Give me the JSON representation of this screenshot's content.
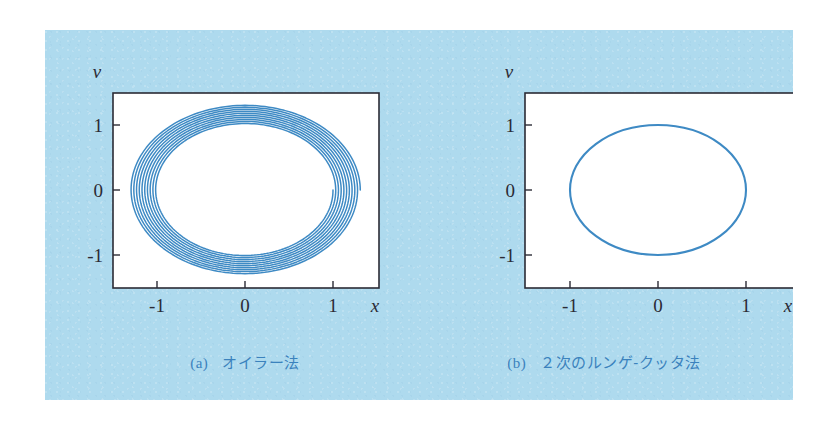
{
  "figure": {
    "background_color": "#aedaee",
    "page_color": "#ffffff",
    "caption_color": "#3b82bd",
    "curve_color": "#3e8ac4",
    "frame_color": "#2b2b35",
    "plot_face_color": "#ffffff"
  },
  "panels": [
    {
      "id": "a",
      "caption_tag": "(a)",
      "caption_text": "オイラー法",
      "xlabel": "x",
      "ylabel": "v",
      "xticks": [
        "-1",
        "0",
        "1"
      ],
      "yticks": [
        "1",
        "0",
        "-1"
      ]
    },
    {
      "id": "b",
      "caption_tag": "(b)",
      "caption_text": "２次のルンゲ-クッタ法",
      "xlabel": "x",
      "ylabel": "v",
      "xticks": [
        "-1",
        "0",
        "1"
      ],
      "yticks": [
        "1",
        "0",
        "-1"
      ]
    }
  ],
  "chart_data": [
    {
      "type": "line",
      "title": "(a) オイラー法",
      "xlabel": "x",
      "ylabel": "v",
      "xlim": [
        -1.45,
        1.52
      ],
      "ylim": [
        -1.49,
        1.53
      ],
      "xticks": [
        -1,
        0,
        1
      ],
      "yticks": [
        -1,
        0,
        1
      ],
      "xticklabels": [
        "-1",
        "0",
        "1"
      ],
      "yticklabels": [
        "-1",
        "0",
        "1"
      ],
      "grid": false,
      "legend": "none",
      "series": [
        {
          "name": "Euler spiral (x,v) of harmonic oscillator",
          "description": "Outward spiral starting at (1,0), radius grows from 1.00 to about 1.31 over 10 revolutions",
          "start_point": [
            1.0,
            0.0
          ],
          "turns": 10,
          "r_start": 1.0,
          "r_end": 1.31,
          "growth_per_turn": 1.0275
        }
      ]
    },
    {
      "type": "line",
      "title": "(b) ２次のルンゲ-クッタ法",
      "xlabel": "x",
      "ylabel": "v",
      "xlim": [
        -1.45,
        1.52
      ],
      "ylim": [
        -1.49,
        1.53
      ],
      "xticks": [
        -1,
        0,
        1
      ],
      "yticks": [
        -1,
        0,
        1
      ],
      "xticklabels": [
        "-1",
        "0",
        "1"
      ],
      "yticklabels": [
        "-1",
        "0",
        "1"
      ],
      "grid": false,
      "legend": "none",
      "series": [
        {
          "name": "Runge-Kutta 2nd order (x,v) of harmonic oscillator",
          "description": "Closed unit circle, radius 1.00, no visible drift",
          "start_point": [
            1.0,
            0.0
          ],
          "turns": 10,
          "r_start": 1.0,
          "r_end": 1.0,
          "growth_per_turn": 1.0
        }
      ]
    }
  ]
}
